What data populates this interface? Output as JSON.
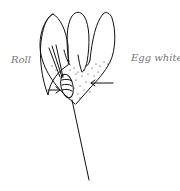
{
  "diagram": {
    "labels": {
      "left": "Roll",
      "right": "Egg white"
    },
    "colors": {
      "stroke": "#111111",
      "label": "#777777",
      "background": "#ffffff"
    }
  }
}
